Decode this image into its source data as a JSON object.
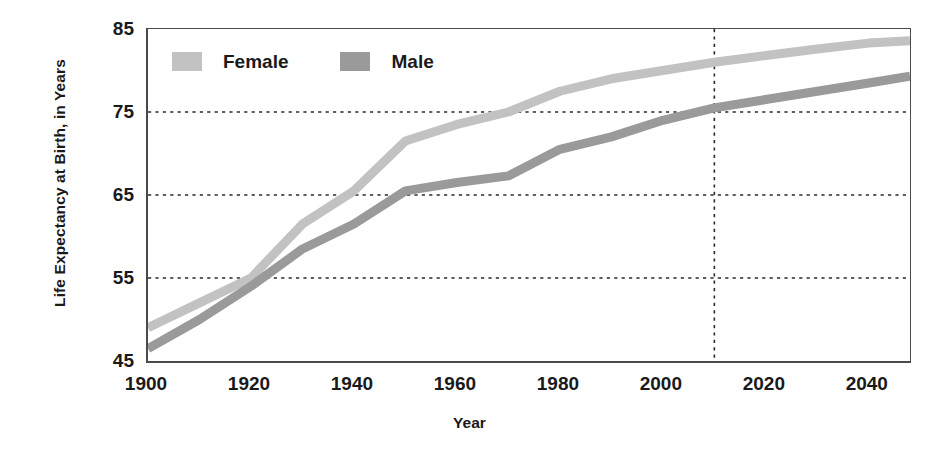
{
  "chart_data": {
    "type": "line",
    "title": "",
    "xlabel": "Year",
    "ylabel": "Life Expectancy at Birth, in Years",
    "xlim": [
      1900,
      2048
    ],
    "ylim": [
      45,
      85
    ],
    "grid": true,
    "grid_axis": "y",
    "legend_position": "top-left-inside",
    "x_ticks": [
      1900,
      1920,
      1940,
      1960,
      1980,
      2000,
      2020,
      2040
    ],
    "x_tick_labels": [
      "1900",
      "1920",
      "1940",
      "1960",
      "1980",
      "2000",
      "2020",
      "2040"
    ],
    "y_ticks": [
      45,
      55,
      65,
      75,
      85
    ],
    "y_tick_labels": [
      "45",
      "55",
      "65",
      "75",
      "85"
    ],
    "gridlines_y": [
      55,
      65,
      75
    ],
    "projection_marker_year": 2010,
    "x": [
      1900,
      1910,
      1920,
      1930,
      1940,
      1950,
      1960,
      1970,
      1980,
      1990,
      2000,
      2010,
      2020,
      2030,
      2040,
      2048
    ],
    "series": [
      {
        "name": "Female",
        "color": "#c2c2c2",
        "values": [
          49.0,
          52.0,
          55.0,
          61.5,
          65.5,
          71.5,
          73.5,
          75.0,
          77.5,
          79.0,
          80.0,
          81.0,
          81.8,
          82.6,
          83.3,
          83.6
        ]
      },
      {
        "name": "Male",
        "color": "#9a9a9a",
        "values": [
          46.5,
          50.0,
          54.0,
          58.5,
          61.5,
          65.5,
          66.5,
          67.3,
          70.5,
          72.0,
          74.0,
          75.5,
          76.5,
          77.5,
          78.5,
          79.3
        ]
      }
    ]
  },
  "axes": {
    "y_title": "Life Expectancy at Birth, in Years",
    "x_title": "Year"
  },
  "legend": {
    "items": [
      {
        "label": "Female",
        "color": "#c2c2c2"
      },
      {
        "label": "Male",
        "color": "#9a9a9a"
      }
    ]
  },
  "colors": {
    "female": "#c2c2c2",
    "male": "#9a9a9a",
    "axis": "#4a4a4a",
    "grid": "#2b2b2b",
    "text": "#1a1a1a",
    "background": "#ffffff"
  }
}
